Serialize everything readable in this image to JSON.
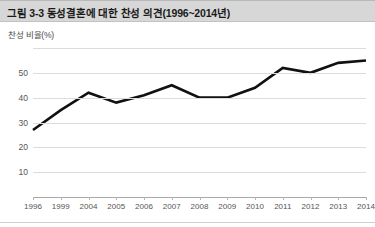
{
  "figure": {
    "title": "그림 3-3 동성결혼에 대한 찬성 의견(1996~2014년)",
    "ylabel": "찬성 비율(%)"
  },
  "chart_data": {
    "type": "line",
    "title": "그림 3-3 동성결혼에 대한 찬성 의견(1996~2014년)",
    "xlabel": "",
    "ylabel": "찬성 비율(%)",
    "categories": [
      "1996",
      "1999",
      "2004",
      "2005",
      "2006",
      "2007",
      "2008",
      "2009",
      "2010",
      "2011",
      "2012",
      "2013",
      "2014"
    ],
    "values": [
      27,
      35,
      42,
      38,
      41,
      45,
      40,
      40,
      44,
      52,
      50,
      54,
      55
    ],
    "series": [
      {
        "name": "찬성 비율(%)",
        "values": [
          27,
          35,
          42,
          38,
          41,
          45,
          40,
          40,
          44,
          52,
          50,
          54,
          55
        ]
      }
    ],
    "ylim": [
      0,
      60
    ],
    "yticks": [
      0,
      10,
      20,
      30,
      40,
      50,
      60
    ],
    "ytick_labels": [
      "",
      "10",
      "20",
      "30",
      "40",
      "50",
      ""
    ],
    "grid": true,
    "legend": false,
    "line_color": "#111111",
    "line_width": 2.6,
    "markers": false
  }
}
